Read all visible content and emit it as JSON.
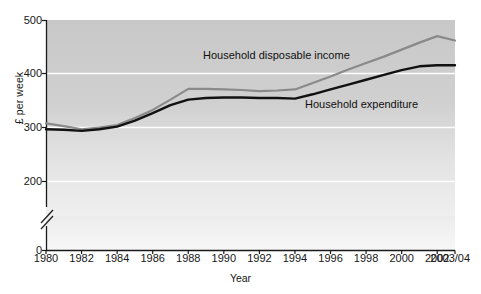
{
  "chart_data": {
    "type": "line",
    "title": "",
    "xlabel": "Year",
    "ylabel": "£ per week",
    "categories": [
      "1980",
      "1981",
      "1982",
      "1983",
      "1984",
      "1985",
      "1986",
      "1987",
      "1988",
      "1989",
      "1990",
      "1991",
      "1992",
      "1993",
      "1994",
      "1995",
      "1996",
      "1997",
      "1998",
      "1999",
      "2000",
      "2001",
      "2002",
      "2003/04"
    ],
    "tick_labels_x": [
      "1980",
      "1982",
      "1984",
      "1986",
      "1988",
      "1990",
      "1992",
      "1994",
      "1996",
      "1998",
      "2000",
      "2002",
      "2003/04"
    ],
    "tick_labels_y": [
      "0",
      "200",
      "300",
      "400",
      "500"
    ],
    "ylim": [
      200,
      500
    ],
    "y_axis_break": true,
    "y_axis_break_note": "axis broken between 0 and 200",
    "grid": "horizontal-white",
    "legend_position": "inline-labels",
    "series": [
      {
        "name": "Household disposable income",
        "color": "#8a8a8a",
        "values": [
          308,
          303,
          297,
          300,
          305,
          318,
          333,
          352,
          372,
          372,
          371,
          370,
          368,
          369,
          371,
          383,
          395,
          408,
          420,
          432,
          445,
          458,
          470,
          462
        ]
      },
      {
        "name": "Household expenditure",
        "color": "#111111",
        "values": [
          297,
          296,
          294,
          297,
          302,
          313,
          327,
          342,
          352,
          355,
          356,
          356,
          355,
          355,
          354,
          362,
          371,
          380,
          389,
          398,
          407,
          414,
          416,
          416
        ]
      }
    ],
    "annotations": [
      {
        "name": "income-label",
        "text": "Household disposable income"
      },
      {
        "name": "expenditure-label",
        "text": "Household expenditure"
      }
    ]
  },
  "axes": {
    "y_title": "£ per week",
    "x_title": "Year",
    "y_ticks": [
      {
        "label": "500",
        "value": 500
      },
      {
        "label": "400",
        "value": 400
      },
      {
        "label": "300",
        "value": 300
      },
      {
        "label": "200",
        "value": 200
      },
      {
        "label": "0",
        "value": 0
      }
    ],
    "x_ticks": [
      {
        "label": "1980"
      },
      {
        "label": "1982"
      },
      {
        "label": "1984"
      },
      {
        "label": "1986"
      },
      {
        "label": "1988"
      },
      {
        "label": "1990"
      },
      {
        "label": "1992"
      },
      {
        "label": "1994"
      },
      {
        "label": "1996"
      },
      {
        "label": "1998"
      },
      {
        "label": "2000"
      },
      {
        "label": "2002"
      },
      {
        "label": "2003/04"
      }
    ]
  },
  "labels": {
    "income": "Household disposable income",
    "expenditure": "Household expenditure"
  },
  "caption": {
    "cropped_text": ""
  },
  "colors": {
    "income_line": "#8a8a8a",
    "expenditure_line": "#111111",
    "plot_background_top": "#c9c9c9",
    "plot_background_bottom": "#ededed",
    "gridline": "#ffffff",
    "axis": "#1a1a1a",
    "text": "#161616"
  }
}
